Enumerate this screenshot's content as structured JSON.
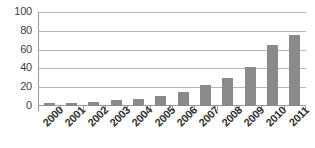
{
  "chart_data": {
    "type": "bar",
    "title": "",
    "subtitle": "",
    "xlabel": "",
    "ylabel": "",
    "categories": [
      "2000",
      "2001",
      "2002",
      "2003",
      "2004",
      "2005",
      "2006",
      "2007",
      "2008",
      "2009",
      "2010",
      "2011"
    ],
    "values": [
      3,
      3,
      4,
      6,
      7,
      11,
      15,
      22,
      30,
      42,
      65,
      76
    ],
    "ylim": [
      0,
      100
    ],
    "yticks": [
      0,
      20,
      40,
      60,
      80,
      100
    ],
    "ytick_labels": [
      "0",
      "20",
      "40",
      "60",
      "80",
      "100"
    ],
    "grid": true,
    "grid_axis": "y",
    "legend": false,
    "legend_position": "none",
    "annotations": [],
    "series": [
      {
        "name": "",
        "values": [
          3,
          3,
          4,
          6,
          7,
          11,
          15,
          22,
          30,
          42,
          65,
          76
        ],
        "color": "#8a8a8a"
      }
    ],
    "x_tick_label_rotation": -45,
    "bar_color": "#8a8a8a",
    "gridline_color": "#b4b4b4",
    "axis_color": "#9a9a9a",
    "background_color": "#ffffff"
  }
}
